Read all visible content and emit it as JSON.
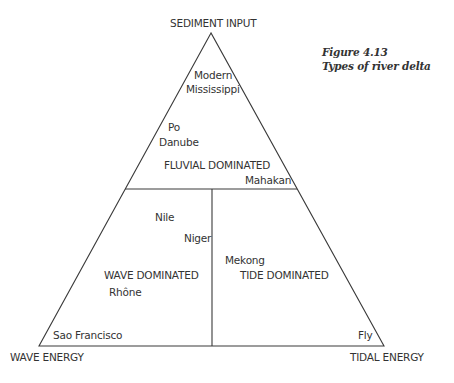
{
  "figure": {
    "number": "Figure 4.13",
    "title": "Types of river delta"
  },
  "vertices": {
    "top": "SEDIMENT INPUT",
    "bottom_left": "WAVE ENERGY",
    "bottom_right": "TIDAL ENERGY"
  },
  "regions": {
    "fluvial": "FLUVIAL DOMINATED",
    "wave": "WAVE DOMINATED",
    "tide": "TIDE DOMINATED"
  },
  "deltas": {
    "modern": "Modern",
    "mississippi": "Mississippi",
    "po": "Po",
    "danube": "Danube",
    "mahakan": "Mahakan",
    "nile": "Nile",
    "niger": "Niger",
    "mekong": "Mekong",
    "rhone": "Rhône",
    "sao_francisco": "Sao Francisco",
    "fly": "Fly"
  },
  "colors": {
    "line": "#3a3a3a",
    "text": "#333333"
  }
}
